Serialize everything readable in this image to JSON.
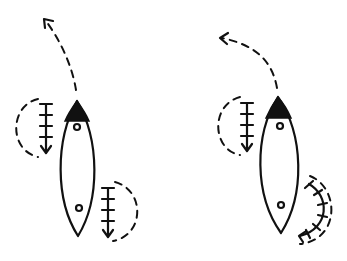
{
  "diagram": {
    "colors": {
      "ink": "#111111",
      "background": "#ffffff"
    },
    "boats": [
      {
        "id": "left",
        "turn_direction": "left",
        "strokes": [
          "straight backward stroke at bow on left side",
          "straight backward stroke at stern on right side"
        ]
      },
      {
        "id": "right",
        "turn_direction": "left",
        "strokes": [
          "straight backward stroke at bow on left side",
          "sweep stroke at stern on right side"
        ]
      }
    ]
  }
}
